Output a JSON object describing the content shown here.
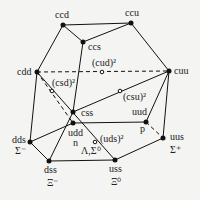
{
  "nodes": {
    "ccd": {
      "label": "ccd",
      "x": 63,
      "y": 25
    },
    "ccu": {
      "label": "ccu",
      "x": 131,
      "y": 23
    },
    "ccs": {
      "label": "ccs",
      "x": 83,
      "y": 42
    },
    "cdd": {
      "label": "cdd",
      "x": 37,
      "y": 72
    },
    "cuu": {
      "label": "cuu",
      "x": 169,
      "y": 71
    },
    "css": {
      "label": "css",
      "x": 73,
      "y": 112
    },
    "udd": {
      "label": "udd",
      "sub": "n",
      "x": 73,
      "y": 123
    },
    "uud": {
      "label": "uud",
      "sub": "p",
      "x": 146,
      "y": 122
    },
    "dds": {
      "label": "dds",
      "sub": "Σ⁻",
      "x": 30,
      "y": 142
    },
    "uus": {
      "label": "uus",
      "sub": "Σ⁺",
      "x": 163,
      "y": 138
    },
    "dss": {
      "label": "dss",
      "sub": "Ξ⁻",
      "x": 49,
      "y": 161
    },
    "uss": {
      "label": "uss",
      "sub": "Ξ⁰",
      "x": 115,
      "y": 160
    }
  },
  "open_points": {
    "cud": {
      "label": "(cud)²",
      "x": 102,
      "y": 72
    },
    "csd": {
      "label": "(csd)²",
      "x": 52,
      "y": 91
    },
    "csu": {
      "label": "(csu)²",
      "x": 120,
      "y": 91
    },
    "uds": {
      "label": "(uds)²",
      "sub": "Λ,Σ⁰",
      "x": 95,
      "y": 142
    }
  }
}
